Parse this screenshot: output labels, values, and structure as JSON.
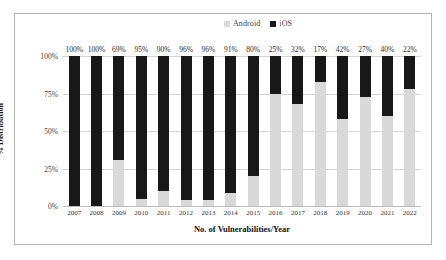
{
  "chart_data": {
    "type": "bar",
    "subtype": "stacked-100-percent",
    "title": "",
    "xlabel": "No. of Vulnerabilities/Year",
    "ylabel": "% Distribution",
    "categories": [
      "2007",
      "2008",
      "2009",
      "2010",
      "2011",
      "2012",
      "2013",
      "2014",
      "2015",
      "2016",
      "2017",
      "2018",
      "2019",
      "2020",
      "2021",
      "2022"
    ],
    "series": [
      {
        "name": "Android",
        "color": "#d9d9d9",
        "values": [
          0,
          0,
          31,
          5,
          10,
          4,
          4,
          9,
          20,
          75,
          68,
          83,
          58,
          73,
          60,
          78
        ]
      },
      {
        "name": "iOS",
        "color": "#181818",
        "values": [
          100,
          100,
          69,
          95,
          90,
          96,
          96,
          91,
          80,
          25,
          32,
          17,
          42,
          27,
          40,
          22
        ]
      }
    ],
    "data_labels": [
      "100%",
      "100%",
      "69%",
      "95%",
      "90%",
      "96%",
      "96%",
      "91%",
      "80%",
      "25%",
      "32%",
      "17%",
      "42%",
      "27%",
      "40%",
      "22%"
    ],
    "data_label_series": "iOS",
    "yticks": [
      "0%",
      "25%",
      "50%",
      "75%",
      "100%"
    ],
    "ytick_values": [
      0,
      25,
      50,
      75,
      100
    ],
    "ylim": [
      0,
      100
    ],
    "grid": true,
    "legend_position": "top-center"
  },
  "legend": {
    "items": [
      {
        "label": "Android",
        "color": "#d9d9d9"
      },
      {
        "label": "iOS",
        "color": "#181818"
      }
    ]
  }
}
